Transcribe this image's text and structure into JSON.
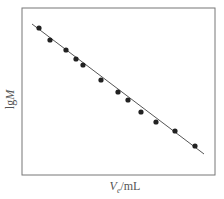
{
  "chart_data": {
    "type": "scatter",
    "title": "",
    "xlabel": "Ve/mL",
    "xlabel_var": "V",
    "xlabel_sub": "e",
    "xlabel_unit": "/mL",
    "ylabel": "lgM",
    "ylabel_prefix": "lg",
    "ylabel_var": "M",
    "grid": false,
    "legend": null,
    "ticks": "none",
    "series": [
      {
        "name": "data",
        "marker": "filled-circle",
        "points_px": [
          [
            39,
            28
          ],
          [
            50,
            40
          ],
          [
            66,
            50
          ],
          [
            76,
            59
          ],
          [
            83,
            65
          ],
          [
            101,
            80
          ],
          [
            118,
            92
          ],
          [
            128,
            100
          ],
          [
            141,
            112
          ],
          [
            156,
            122
          ],
          [
            175,
            131
          ],
          [
            195,
            146
          ]
        ],
        "relative_values": [
          {
            "x": 0.09,
            "y": 0.88
          },
          {
            "x": 0.15,
            "y": 0.81
          },
          {
            "x": 0.23,
            "y": 0.75
          },
          {
            "x": 0.28,
            "y": 0.7
          },
          {
            "x": 0.32,
            "y": 0.66
          },
          {
            "x": 0.41,
            "y": 0.57
          },
          {
            "x": 0.5,
            "y": 0.5
          },
          {
            "x": 0.55,
            "y": 0.45
          },
          {
            "x": 0.62,
            "y": 0.38
          },
          {
            "x": 0.69,
            "y": 0.32
          },
          {
            "x": 0.79,
            "y": 0.26
          },
          {
            "x": 0.9,
            "y": 0.17
          }
        ]
      },
      {
        "name": "linear fit",
        "type": "line",
        "line_px": [
          [
            32,
            24
          ],
          [
            204,
            154
          ]
        ]
      }
    ],
    "frame_px": {
      "left": 22,
      "top": 8,
      "right": 215,
      "bottom": 175
    },
    "colors": {
      "frame": "#777777",
      "line": "#555555",
      "marker": "#222222",
      "text": "#555555"
    }
  }
}
